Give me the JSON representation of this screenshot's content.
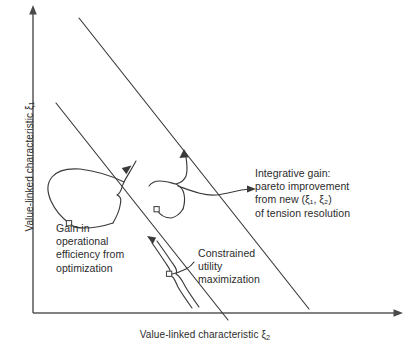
{
  "figure": {
    "background_color": "#ffffff",
    "line_color": "#3a3a3a",
    "axis_color": "#575757",
    "axes": {
      "y_title_prefix": "Value-linked characteristic ",
      "y_title_symbol": "ξ",
      "y_title_sub": "1",
      "x_title_prefix": "Value-linked characteristic ",
      "x_title_symbol": "ξ",
      "x_title_sub": "2"
    },
    "annotations": {
      "gain_operational": "Gain in\noperational\nefficiency from\noptimization",
      "integrative_gain": "Integrative gain:\npareto improvement\nfrom new (ξ₁, ξ₂)\nof tension resolution",
      "constrained_utility": "Constrained\nutility\nmaximization"
    },
    "elements": {
      "frontier_outer_label": "outer pareto frontier line",
      "frontier_inner_label": "inner pareto frontier line",
      "brace_left_label": "brace for operational efficiency gain",
      "brace_middle_label": "brace for integrative gain",
      "brace_lower_label": "brace for constrained utility maximization"
    }
  }
}
